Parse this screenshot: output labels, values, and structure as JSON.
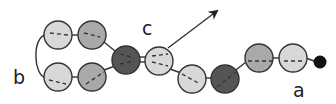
{
  "diagram": {
    "labels": {
      "a": "a",
      "b": "b",
      "c": "c"
    },
    "colors": {
      "light": "#d8d8d8",
      "medium": "#a9a9a9",
      "dark": "#555555",
      "black": "#111111",
      "stroke": "#333333"
    },
    "beads": [
      {
        "id": "top-left",
        "shade": "light"
      },
      {
        "id": "top-middle",
        "shade": "medium"
      },
      {
        "id": "bottom-left",
        "shade": "light"
      },
      {
        "id": "bottom-middle",
        "shade": "medium"
      },
      {
        "id": "branch-node",
        "shade": "dark"
      },
      {
        "id": "after-branch",
        "shade": "light"
      },
      {
        "id": "lower-light",
        "shade": "light"
      },
      {
        "id": "lower-dark",
        "shade": "dark"
      },
      {
        "id": "chain-medium",
        "shade": "medium"
      },
      {
        "id": "chain-light",
        "shade": "light"
      },
      {
        "id": "terminal-dot",
        "shade": "black"
      }
    ]
  }
}
